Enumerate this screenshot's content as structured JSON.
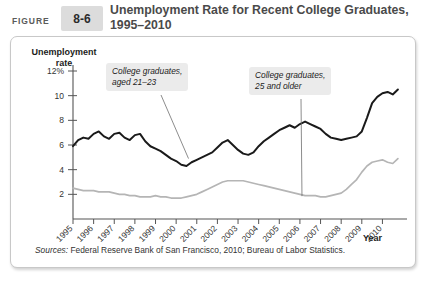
{
  "header": {
    "figure_word": "FIGURE",
    "figure_number": "8-6",
    "title": "Unemployment Rate for Recent College Graduates, 1995–2010"
  },
  "source": {
    "label": "Sources:",
    "text": " Federal Reserve Bank of San Francisco, 2010; Bureau of Labor Statistics."
  },
  "colors": {
    "series_young": "#1a1a1a",
    "series_older": "#b5b5b5",
    "axis": "#555555",
    "annotation_bg": "#ebebeb",
    "badge_bg": "#dcdcdc",
    "panel_border": "#c8c8c8"
  },
  "chart_data": {
    "type": "line",
    "title": "Unemployment Rate for Recent College Graduates, 1995–2010",
    "xlabel": "Year",
    "ylabel": "Unemployment rate",
    "ylim": [
      0,
      12
    ],
    "xlim": [
      1995,
      2010.9
    ],
    "grid": false,
    "legend_position": "inline-annotations",
    "ytick_labels": [
      "12%",
      "10",
      "8",
      "6",
      "4",
      "2"
    ],
    "ytick_values": [
      12,
      10,
      8,
      6,
      4,
      2
    ],
    "xtick_labels": [
      "1995",
      "1996",
      "1997",
      "1998",
      "1999",
      "2000",
      "2001",
      "2002",
      "2003",
      "2004",
      "2005",
      "2006",
      "2007",
      "2008",
      "2009",
      "2010"
    ],
    "xtick_values": [
      1995,
      1996,
      1997,
      1998,
      1999,
      2000,
      2001,
      2002,
      2003,
      2004,
      2005,
      2006,
      2007,
      2008,
      2009,
      2010
    ],
    "annotations": [
      {
        "name": "young-graduates",
        "text_line1": "College graduates,",
        "text_line2": "aged 21–23",
        "points_to_x": 2000.6,
        "points_to_y": 4.9
      },
      {
        "name": "older-graduates",
        "text_line1": "College graduates,",
        "text_line2": "25 and older",
        "points_to_x": 2006.1,
        "points_to_y": 1.85
      }
    ],
    "series": [
      {
        "name": "College graduates, aged 21–23",
        "color": "#1a1a1a",
        "x": [
          1995.0,
          1995.25,
          1995.5,
          1995.75,
          1996.0,
          1996.25,
          1996.5,
          1996.75,
          1997.0,
          1997.25,
          1997.5,
          1997.75,
          1998.0,
          1998.25,
          1998.5,
          1998.75,
          1999.0,
          1999.25,
          1999.5,
          1999.75,
          2000.0,
          2000.25,
          2000.5,
          2000.75,
          2001.0,
          2001.25,
          2001.5,
          2001.75,
          2002.0,
          2002.25,
          2002.5,
          2002.75,
          2003.0,
          2003.25,
          2003.5,
          2003.75,
          2004.0,
          2004.25,
          2004.5,
          2004.75,
          2005.0,
          2005.25,
          2005.5,
          2005.75,
          2006.0,
          2006.25,
          2006.5,
          2006.75,
          2007.0,
          2007.25,
          2007.5,
          2007.75,
          2008.0,
          2008.25,
          2008.5,
          2008.75,
          2009.0,
          2009.25,
          2009.5,
          2009.75,
          2010.0,
          2010.25,
          2010.5,
          2010.75
        ],
        "y": [
          5.9,
          6.4,
          6.6,
          6.5,
          6.9,
          7.1,
          6.7,
          6.5,
          6.9,
          7.0,
          6.6,
          6.4,
          6.8,
          6.9,
          6.3,
          5.9,
          5.7,
          5.5,
          5.2,
          4.9,
          4.7,
          4.4,
          4.3,
          4.6,
          4.8,
          5.0,
          5.2,
          5.4,
          5.8,
          6.2,
          6.4,
          6.0,
          5.6,
          5.3,
          5.2,
          5.4,
          5.9,
          6.3,
          6.6,
          6.9,
          7.2,
          7.4,
          7.6,
          7.4,
          7.7,
          7.9,
          7.7,
          7.5,
          7.3,
          6.9,
          6.6,
          6.5,
          6.4,
          6.5,
          6.6,
          6.7,
          7.1,
          8.2,
          9.4,
          9.9,
          10.2,
          10.3,
          10.1,
          10.5
        ],
        "final_value": 10.5,
        "start_value": 5.9,
        "min_value": 4.3,
        "max_value": 10.5
      },
      {
        "name": "College graduates, 25 and older",
        "color": "#b5b5b5",
        "x": [
          1995.0,
          1995.25,
          1995.5,
          1995.75,
          1996.0,
          1996.25,
          1996.5,
          1996.75,
          1997.0,
          1997.25,
          1997.5,
          1997.75,
          1998.0,
          1998.25,
          1998.5,
          1998.75,
          1999.0,
          1999.25,
          1999.5,
          1999.75,
          2000.0,
          2000.25,
          2000.5,
          2000.75,
          2001.0,
          2001.25,
          2001.5,
          2001.75,
          2002.0,
          2002.25,
          2002.5,
          2002.75,
          2003.0,
          2003.25,
          2003.5,
          2003.75,
          2004.0,
          2004.25,
          2004.5,
          2004.75,
          2005.0,
          2005.25,
          2005.5,
          2005.75,
          2006.0,
          2006.25,
          2006.5,
          2006.75,
          2007.0,
          2007.25,
          2007.5,
          2007.75,
          2008.0,
          2008.25,
          2008.5,
          2008.75,
          2009.0,
          2009.25,
          2009.5,
          2009.75,
          2010.0,
          2010.25,
          2010.5,
          2010.75
        ],
        "y": [
          2.5,
          2.4,
          2.3,
          2.3,
          2.3,
          2.2,
          2.2,
          2.2,
          2.1,
          2.0,
          2.0,
          1.9,
          1.9,
          1.8,
          1.8,
          1.8,
          1.9,
          1.8,
          1.8,
          1.7,
          1.7,
          1.7,
          1.8,
          1.9,
          2.0,
          2.2,
          2.4,
          2.6,
          2.8,
          3.0,
          3.1,
          3.1,
          3.1,
          3.1,
          3.0,
          2.9,
          2.8,
          2.7,
          2.6,
          2.5,
          2.4,
          2.3,
          2.2,
          2.1,
          2.0,
          1.9,
          1.9,
          1.9,
          1.8,
          1.8,
          1.9,
          2.0,
          2.1,
          2.4,
          2.8,
          3.2,
          3.8,
          4.3,
          4.6,
          4.7,
          4.8,
          4.6,
          4.5,
          4.9
        ],
        "final_value": 4.9,
        "start_value": 2.5,
        "min_value": 1.7,
        "max_value": 4.9
      }
    ]
  }
}
